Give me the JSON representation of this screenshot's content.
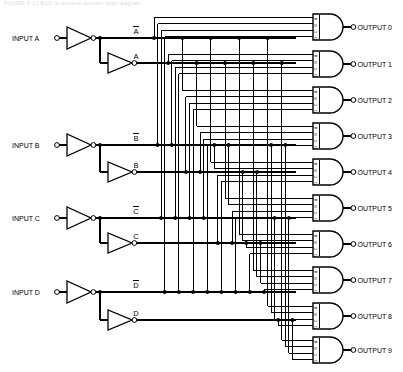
{
  "diagram": {
    "title": "BCD-to-Decimal Decoder Logic Diagram",
    "faded_header": "FIGURE 9-13   BCD-to-decimal decoder logic diagram",
    "line_color": "#000000",
    "background": "#ffffff"
  },
  "inputs": [
    {
      "label": "INPUT A",
      "true_label": "A",
      "bar_label": "A",
      "bar": true
    },
    {
      "label": "INPUT B",
      "true_label": "B",
      "bar_label": "B",
      "bar": true
    },
    {
      "label": "INPUT C",
      "true_label": "C",
      "bar_label": "C",
      "bar": true
    },
    {
      "label": "INPUT D",
      "true_label": "D",
      "bar_label": "D",
      "bar": true
    }
  ],
  "rails": [
    {
      "name": "A-bar",
      "label": "A",
      "bar": true,
      "y": 38
    },
    {
      "name": "A",
      "label": "A",
      "bar": false,
      "y": 63
    },
    {
      "name": "B-bar",
      "label": "B",
      "bar": true,
      "y": 145
    },
    {
      "name": "B",
      "label": "B",
      "bar": false,
      "y": 172
    },
    {
      "name": "C-bar",
      "label": "C",
      "bar": true,
      "y": 218
    },
    {
      "name": "C",
      "label": "C",
      "bar": false,
      "y": 243
    },
    {
      "name": "D-bar",
      "label": "D",
      "bar": true,
      "y": 292
    },
    {
      "name": "D",
      "label": "D",
      "bar": false,
      "y": 320
    }
  ],
  "gate_input_labels": [
    "A",
    "B",
    "C",
    "D"
  ],
  "outputs": [
    {
      "label": "OUTPUT 0",
      "y": 27,
      "terms": [
        "A-bar",
        "B-bar",
        "C-bar",
        "D-bar"
      ]
    },
    {
      "label": "OUTPUT 1",
      "y": 64,
      "terms": [
        "A",
        "B-bar",
        "C-bar",
        "D-bar"
      ]
    },
    {
      "label": "OUTPUT 2",
      "y": 100,
      "terms": [
        "A-bar",
        "B",
        "C-bar",
        "D-bar"
      ]
    },
    {
      "label": "OUTPUT 3",
      "y": 136,
      "terms": [
        "A",
        "B",
        "C-bar",
        "D-bar"
      ]
    },
    {
      "label": "OUTPUT 4",
      "y": 172,
      "terms": [
        "A-bar",
        "B-bar",
        "C",
        "D-bar"
      ]
    },
    {
      "label": "OUTPUT 5",
      "y": 208,
      "terms": [
        "A",
        "B-bar",
        "C",
        "D-bar"
      ]
    },
    {
      "label": "OUTPUT 6",
      "y": 244,
      "terms": [
        "A-bar",
        "B",
        "C",
        "D-bar"
      ]
    },
    {
      "label": "OUTPUT 7",
      "y": 280,
      "terms": [
        "A",
        "B",
        "C",
        "D-bar"
      ]
    },
    {
      "label": "OUTPUT 8",
      "y": 316,
      "terms": [
        "A-bar",
        "B-bar",
        "C-bar",
        "D"
      ]
    },
    {
      "label": "OUTPUT 9",
      "y": 350,
      "terms": [
        "A",
        "B-bar",
        "C-bar",
        "D"
      ]
    }
  ]
}
